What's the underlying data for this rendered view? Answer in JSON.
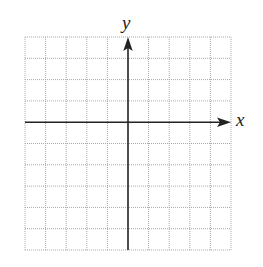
{
  "diagram": {
    "type": "coordinate-plane",
    "x_axis_label": "x",
    "y_axis_label": "y",
    "grid": {
      "columns": 10,
      "rows": 10,
      "line_style": "dotted",
      "line_color": "#a8a8a8"
    },
    "axis_color": "#222222",
    "origin_cell": {
      "column": 5,
      "row": 4
    }
  }
}
